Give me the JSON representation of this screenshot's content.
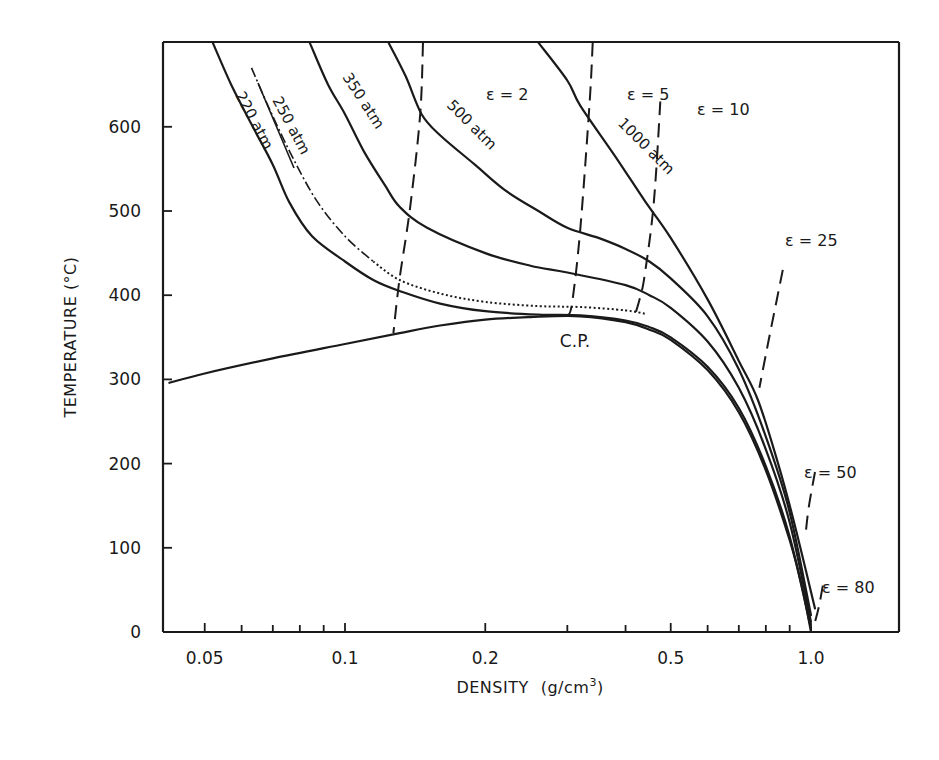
{
  "chart_data": {
    "type": "line",
    "title": "",
    "xlabel": "DENSITY (g/cm³)",
    "xlabel_main": "DENSITY",
    "xlabel_unit": "(g/cm",
    "xlabel_sup": "3",
    "xlabel_close": ")",
    "ylabel": "TEMPERATURE (°C)",
    "xscale": "log",
    "xlim": [
      0.042,
      1.6
    ],
    "ylim": [
      0,
      700
    ],
    "grid": false,
    "legend": "none (inline curve labels)",
    "x_ticks": [
      {
        "value": 0.05,
        "label": "0.05"
      },
      {
        "value": 0.06,
        "label": ""
      },
      {
        "value": 0.07,
        "label": ""
      },
      {
        "value": 0.08,
        "label": ""
      },
      {
        "value": 0.09,
        "label": ""
      },
      {
        "value": 0.1,
        "label": "0.1"
      },
      {
        "value": 0.2,
        "label": "0.2"
      },
      {
        "value": 0.3,
        "label": ""
      },
      {
        "value": 0.4,
        "label": ""
      },
      {
        "value": 0.5,
        "label": "0.5"
      },
      {
        "value": 0.6,
        "label": ""
      },
      {
        "value": 0.7,
        "label": ""
      },
      {
        "value": 0.8,
        "label": ""
      },
      {
        "value": 0.9,
        "label": ""
      },
      {
        "value": 1.0,
        "label": "1.0"
      }
    ],
    "y_ticks": [
      {
        "value": 0,
        "label": "0"
      },
      {
        "value": 100,
        "label": "100"
      },
      {
        "value": 200,
        "label": "200"
      },
      {
        "value": 300,
        "label": "300"
      },
      {
        "value": 400,
        "label": "400"
      },
      {
        "value": 500,
        "label": "500"
      },
      {
        "value": 600,
        "label": "600"
      }
    ],
    "annotations": [
      {
        "text": "C.P.",
        "x": 0.3,
        "y": 345,
        "meaning": "critical point"
      }
    ],
    "series": [
      {
        "name": "coexistence curve (vapor-liquid)",
        "style": "solid",
        "points": [
          [
            0.042,
            296
          ],
          [
            0.05,
            307
          ],
          [
            0.07,
            325
          ],
          [
            0.1,
            342
          ],
          [
            0.131,
            355
          ],
          [
            0.16,
            364
          ],
          [
            0.2,
            371
          ],
          [
            0.25,
            374
          ],
          [
            0.32,
            375
          ],
          [
            0.4,
            368
          ],
          [
            0.45,
            359
          ],
          [
            0.5,
            347
          ],
          [
            0.6,
            311
          ],
          [
            0.7,
            261
          ],
          [
            0.8,
            192
          ],
          [
            0.9,
            109
          ],
          [
            0.96,
            50
          ],
          [
            1.0,
            0
          ]
        ]
      },
      {
        "name": "220 atm",
        "style": "solid",
        "label": "220 atm",
        "points": [
          [
            0.052,
            700
          ],
          [
            0.057,
            650
          ],
          [
            0.063,
            603
          ],
          [
            0.07,
            555
          ],
          [
            0.076,
            510
          ],
          [
            0.085,
            470
          ],
          [
            0.1,
            440
          ],
          [
            0.115,
            418
          ],
          [
            0.131,
            405
          ],
          [
            0.16,
            390
          ],
          [
            0.2,
            381
          ],
          [
            0.26,
            377
          ],
          [
            0.32,
            376
          ],
          [
            0.4,
            370
          ],
          [
            0.45,
            362
          ],
          [
            0.5,
            350
          ],
          [
            0.6,
            315
          ],
          [
            0.7,
            266
          ],
          [
            0.8,
            197
          ],
          [
            0.9,
            113
          ],
          [
            1.0,
            4
          ]
        ]
      },
      {
        "name": "250 atm",
        "style": "dash-dot / dotted",
        "label": "250 atm",
        "points": [
          [
            0.063,
            670
          ],
          [
            0.069,
            620
          ],
          [
            0.077,
            565
          ],
          [
            0.087,
            512
          ],
          [
            0.1,
            470
          ],
          [
            0.115,
            440
          ],
          [
            0.131,
            418
          ],
          [
            0.16,
            402
          ],
          [
            0.2,
            392
          ],
          [
            0.26,
            387
          ],
          [
            0.32,
            386
          ],
          [
            0.4,
            382
          ],
          [
            0.44,
            378
          ]
        ]
      },
      {
        "name": "350 atm",
        "style": "solid",
        "label": "350 atm",
        "points": [
          [
            0.084,
            700
          ],
          [
            0.092,
            650
          ],
          [
            0.1,
            615
          ],
          [
            0.11,
            570
          ],
          [
            0.122,
            530
          ],
          [
            0.131,
            505
          ],
          [
            0.15,
            480
          ],
          [
            0.2,
            450
          ],
          [
            0.25,
            435
          ],
          [
            0.3,
            427
          ],
          [
            0.4,
            412
          ],
          [
            0.45,
            400
          ],
          [
            0.5,
            385
          ],
          [
            0.6,
            345
          ],
          [
            0.7,
            290
          ],
          [
            0.8,
            217
          ],
          [
            0.9,
            130
          ],
          [
            1.0,
            12
          ]
        ]
      },
      {
        "name": "500 atm",
        "style": "solid",
        "label": "500 atm",
        "points": [
          [
            0.124,
            700
          ],
          [
            0.135,
            660
          ],
          [
            0.146,
            615
          ],
          [
            0.16,
            590
          ],
          [
            0.19,
            555
          ],
          [
            0.22,
            525
          ],
          [
            0.26,
            500
          ],
          [
            0.3,
            480
          ],
          [
            0.35,
            468
          ],
          [
            0.4,
            455
          ],
          [
            0.45,
            440
          ],
          [
            0.5,
            420
          ],
          [
            0.6,
            375
          ],
          [
            0.7,
            312
          ],
          [
            0.8,
            232
          ],
          [
            0.9,
            142
          ],
          [
            1.0,
            20
          ]
        ]
      },
      {
        "name": "1000 atm",
        "style": "solid",
        "label": "1000 atm",
        "points": [
          [
            0.26,
            700
          ],
          [
            0.3,
            655
          ],
          [
            0.32,
            625
          ],
          [
            0.38,
            565
          ],
          [
            0.44,
            512
          ],
          [
            0.5,
            468
          ],
          [
            0.6,
            395
          ],
          [
            0.7,
            322
          ],
          [
            0.77,
            275
          ],
          [
            0.85,
            200
          ],
          [
            0.92,
            130
          ],
          [
            1.02,
            28
          ]
        ]
      },
      {
        "name": "ε = 2",
        "style": "dashed",
        "label": "ε = 2",
        "points": [
          [
            0.147,
            700
          ],
          [
            0.145,
            615
          ],
          [
            0.138,
            505
          ],
          [
            0.131,
            420
          ],
          [
            0.127,
            355
          ]
        ]
      },
      {
        "name": "ε = 5",
        "style": "dashed",
        "label": "ε = 5",
        "points": [
          [
            0.34,
            700
          ],
          [
            0.335,
            630
          ],
          [
            0.32,
            480
          ],
          [
            0.307,
            390
          ],
          [
            0.3,
            376
          ]
        ]
      },
      {
        "name": "ε = 10",
        "style": "dashed",
        "label": "ε = 10",
        "points": [
          [
            0.475,
            630
          ],
          [
            0.46,
            510
          ],
          [
            0.44,
            425
          ],
          [
            0.43,
            398
          ],
          [
            0.42,
            378
          ]
        ]
      },
      {
        "name": "ε = 25",
        "style": "dashed",
        "label": "ε = 25",
        "points": [
          [
            0.87,
            430
          ],
          [
            0.81,
            345
          ],
          [
            0.775,
            290
          ]
        ]
      },
      {
        "name": "ε = 50",
        "style": "dashed",
        "label": "ε = 50",
        "points": [
          [
            1.02,
            190
          ],
          [
            0.99,
            150
          ],
          [
            0.975,
            120
          ]
        ]
      },
      {
        "name": "ε = 80",
        "style": "dashed",
        "label": "ε = 80",
        "points": [
          [
            1.06,
            55
          ],
          [
            1.04,
            30
          ],
          [
            1.02,
            12
          ]
        ]
      }
    ],
    "curve_labels": [
      {
        "text": "220 atm",
        "x": 235,
        "y": 95,
        "rot": 62
      },
      {
        "text": "250 atm",
        "x": 272,
        "y": 100,
        "rot": 62
      },
      {
        "text": "350 atm",
        "x": 342,
        "y": 77,
        "rot": 57
      },
      {
        "text": "500 atm",
        "x": 446,
        "y": 106,
        "rot": 45
      },
      {
        "text": "1000 atm",
        "x": 617,
        "y": 124,
        "rot": 45
      }
    ],
    "eps_labels": [
      {
        "text": "ε = 2",
        "x": 486,
        "y": 100
      },
      {
        "text": "ε = 5",
        "x": 627,
        "y": 100
      },
      {
        "text": "ε = 10",
        "x": 697,
        "y": 115
      },
      {
        "text": "ε = 25",
        "x": 785,
        "y": 246
      },
      {
        "text": "ε = 50",
        "x": 804,
        "y": 478
      },
      {
        "text": "ε = 80",
        "x": 822,
        "y": 593
      }
    ]
  }
}
